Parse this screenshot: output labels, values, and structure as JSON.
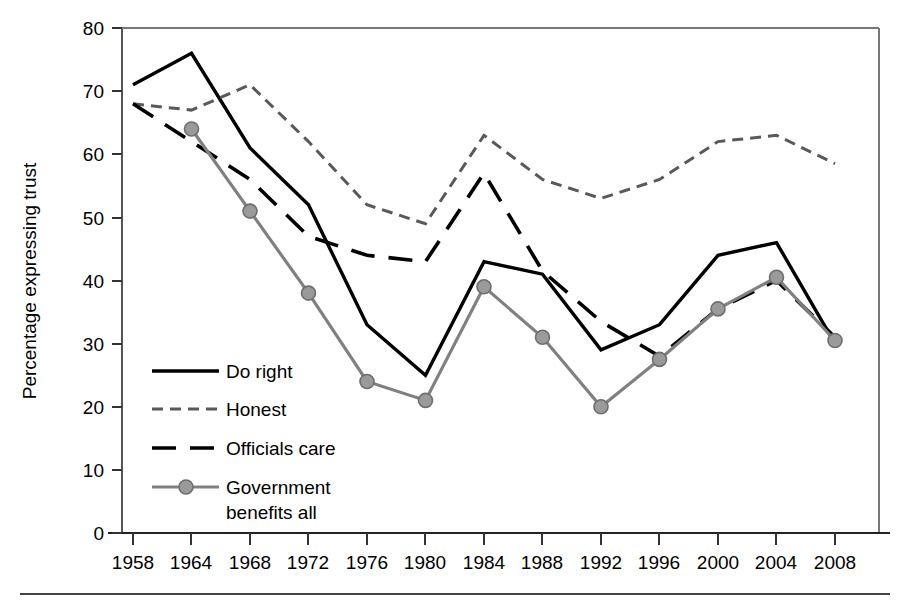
{
  "chart_data": {
    "type": "line",
    "title": "",
    "subtitle": "",
    "xlabel": "",
    "ylabel": "Percentage expressing trust",
    "xlim": [
      1958,
      2008
    ],
    "ylim": [
      0,
      80
    ],
    "ytick_step": 10,
    "grid": false,
    "legend_position": "inside-lower-left",
    "categories": [
      "1958",
      "1964",
      "1968",
      "1972",
      "1976",
      "1980",
      "1984",
      "1988",
      "1992",
      "1996",
      "2000",
      "2004",
      "2008"
    ],
    "x": [
      1958,
      1964,
      1968,
      1972,
      1976,
      1980,
      1984,
      1988,
      1992,
      1996,
      2000,
      2004,
      2008
    ],
    "yticks": [
      "0",
      "10",
      "20",
      "30",
      "40",
      "50",
      "60",
      "70",
      "80"
    ],
    "series": [
      {
        "name": "Do right",
        "style": "solid",
        "color": "#000000",
        "marker": "none",
        "values": [
          71,
          76,
          61,
          52,
          33,
          25,
          43,
          41,
          29,
          33,
          44,
          46,
          30
        ]
      },
      {
        "name": "Honest",
        "style": "dashed-fine",
        "color": "#595959",
        "marker": "none",
        "values": [
          68,
          67,
          71,
          62,
          52,
          49,
          63,
          56,
          53,
          56,
          62,
          63,
          58.5
        ]
      },
      {
        "name": "Officials care",
        "style": "dashed-long",
        "color": "#000000",
        "marker": "none",
        "values": [
          68,
          62,
          56,
          47,
          44,
          43,
          57,
          41.5,
          33.5,
          28,
          35.5,
          40,
          31
        ]
      },
      {
        "name": "Government benefits all",
        "style": "solid-marker",
        "color": "#808080",
        "marker": "circle",
        "values": [
          null,
          64,
          51,
          38,
          24,
          21,
          39,
          31,
          20,
          27.5,
          35.5,
          40.5,
          30.5
        ]
      }
    ]
  },
  "legend": {
    "items": [
      {
        "label": "Do right",
        "label2": ""
      },
      {
        "label": "Honest",
        "label2": ""
      },
      {
        "label": "Officials care",
        "label2": ""
      },
      {
        "label": "Government",
        "label2": "benefits all"
      }
    ]
  },
  "axis": {
    "y_title": "Percentage expressing trust",
    "y_tick_0": "0",
    "y_tick_10": "10",
    "y_tick_20": "20",
    "y_tick_30": "30",
    "y_tick_40": "40",
    "y_tick_50": "50",
    "y_tick_60": "60",
    "y_tick_70": "70",
    "y_tick_80": "80",
    "x_tick_0": "1958",
    "x_tick_1": "1964",
    "x_tick_2": "1968",
    "x_tick_3": "1972",
    "x_tick_4": "1976",
    "x_tick_5": "1980",
    "x_tick_6": "1984",
    "x_tick_7": "1988",
    "x_tick_8": "1992",
    "x_tick_9": "1996",
    "x_tick_10": "2000",
    "x_tick_11": "2004",
    "x_tick_12": "2008"
  }
}
